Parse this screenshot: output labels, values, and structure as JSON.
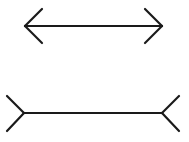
{
  "diagram": {
    "stroke_color": "#1a1a1a",
    "background": "#ffffff",
    "figures": [
      {
        "name": "arrowheads-inward-line",
        "shaft": {
          "x1": 25,
          "y1": 26,
          "x2": 162,
          "y2": 26
        },
        "ends": [
          {
            "tip": [
              25,
              26
            ],
            "arm1": [
              42,
              9
            ],
            "arm2": [
              42,
              43
            ]
          },
          {
            "tip": [
              162,
              26
            ],
            "arm1": [
              145,
              9
            ],
            "arm2": [
              145,
              43
            ]
          }
        ]
      },
      {
        "name": "fins-outward-line",
        "shaft": {
          "x1": 24,
          "y1": 113,
          "x2": 162,
          "y2": 113
        },
        "ends": [
          {
            "tip": [
              24,
              113
            ],
            "arm1": [
              7,
              96
            ],
            "arm2": [
              7,
              131
            ]
          },
          {
            "tip": [
              162,
              113
            ],
            "arm1": [
              179,
              96
            ],
            "arm2": [
              179,
              131
            ]
          }
        ]
      }
    ]
  }
}
